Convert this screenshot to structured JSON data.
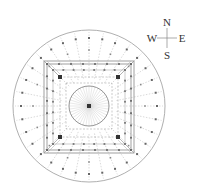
{
  "diagram": {
    "type": "architectural-plan",
    "colors": {
      "line": "#9a9a9a",
      "dark": "#444444",
      "dot": "#555555",
      "background": "#ffffff"
    },
    "outer_circle": {
      "cx": 89,
      "cy": 106,
      "r": 76
    },
    "inner_circle": {
      "cx": 89,
      "cy": 106,
      "r": 20
    },
    "squares": [
      {
        "x": 44,
        "y": 61,
        "w": 90,
        "h": 92
      },
      {
        "x": 47,
        "y": 64,
        "w": 84,
        "h": 86
      },
      {
        "x": 53,
        "y": 70,
        "w": 72,
        "h": 74
      },
      {
        "x": 60,
        "y": 77,
        "w": 58,
        "h": 60
      },
      {
        "x": 66,
        "y": 83,
        "w": 46,
        "h": 46
      }
    ],
    "radial_lines": 32,
    "inner_radial_lines": 40
  },
  "compass": {
    "north": "N",
    "south": "S",
    "east": "E",
    "west": "W",
    "cx": 167,
    "cy": 38
  }
}
